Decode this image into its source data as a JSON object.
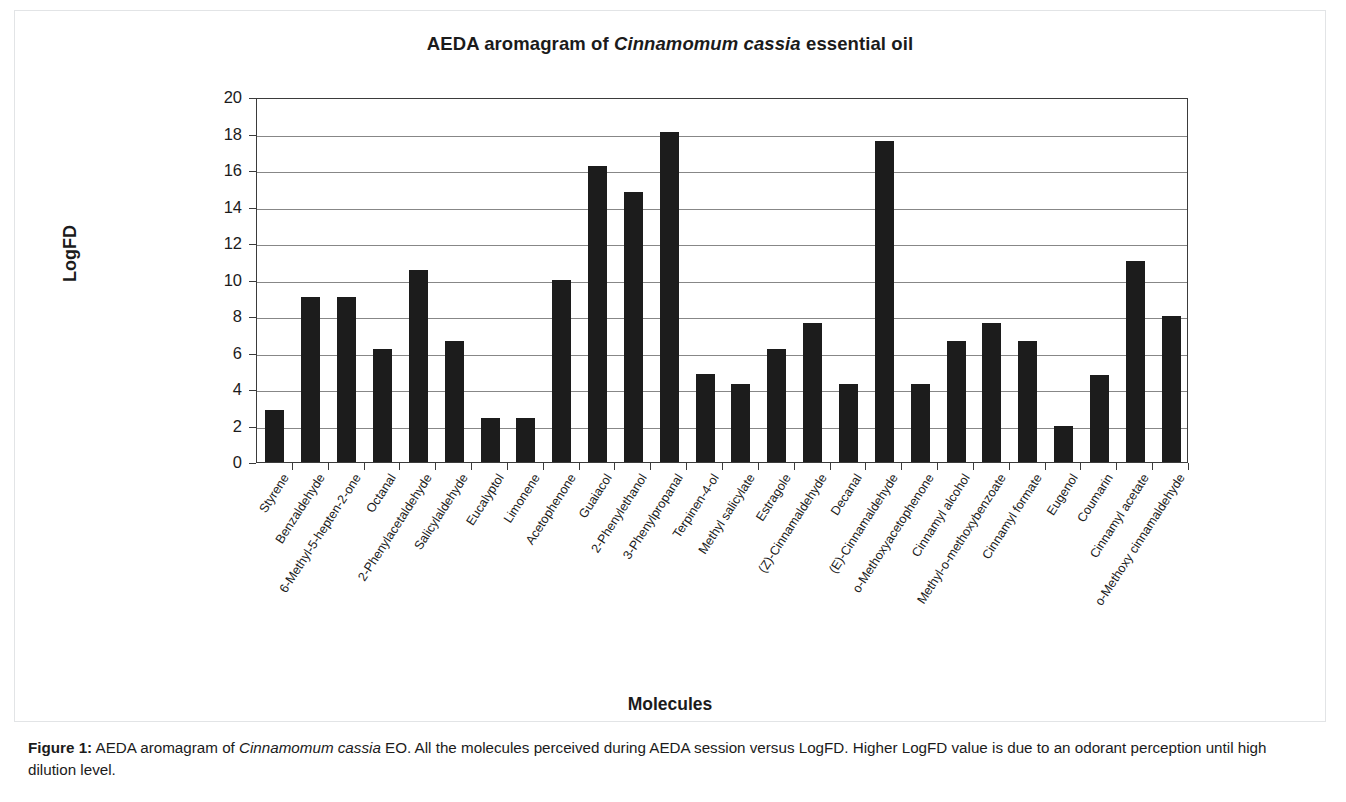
{
  "figure": {
    "title_parts": {
      "pre": "AEDA aromagram of ",
      "species": "Cinnamomum cassia",
      "post": " essential oil"
    },
    "title_full": "AEDA aromagram of Cinnamomum cassia essential oil",
    "caption": {
      "label": "Figure 1:",
      "text_before_species": " AEDA aromagram of ",
      "species": "Cinnamomum cassia",
      "text_after_species": " EO. All the molecules perceived during AEDA session versus LogFD. Higher LogFD value is due to an odorant perception until high dilution level."
    }
  },
  "chart_data": {
    "type": "bar",
    "title": "AEDA aromagram of Cinnamomum cassia essential oil",
    "xlabel": "Molecules",
    "ylabel": "LogFD",
    "ylim": [
      0,
      20
    ],
    "ytick_step": 2,
    "yticks": [
      0,
      2,
      4,
      6,
      8,
      10,
      12,
      14,
      16,
      18,
      20
    ],
    "grid": true,
    "legend": false,
    "bar_color": "#1c1c1c",
    "categories": [
      "Styrene",
      "Benzaldehyde",
      "6-Methyl-5-hepten-2-one",
      "Octanal",
      "2-Phenylacetaldehyde",
      "Salicylaldehyde",
      "Eucalyptol",
      "Limonene",
      "Acetophenone",
      "Guaiacol",
      "2-Phenylethanol",
      "3-Phenylpropanal",
      "Terpinen-4-ol",
      "Methyl salicylate",
      "Estragole",
      "(Z)-Cinnamaldehyde",
      "Decanal",
      "(E)-Cinnamaldehyde",
      "o-Methoxyacetophenone",
      "Cinnamyl alcohol",
      "Methyl-o-methoxybenzoate",
      "Cinnamyl formate",
      "Eugenol",
      "Coumarin",
      "Cinnamyl acetate",
      "o-Methoxy cinnamaldehyde"
    ],
    "values": [
      2.85,
      9.05,
      9.05,
      6.2,
      10.5,
      6.65,
      2.4,
      2.4,
      10.0,
      16.2,
      14.8,
      18.1,
      4.8,
      4.3,
      6.2,
      7.6,
      4.3,
      17.6,
      4.3,
      6.65,
      7.6,
      6.65,
      1.95,
      4.75,
      11.0,
      8.0
    ]
  }
}
